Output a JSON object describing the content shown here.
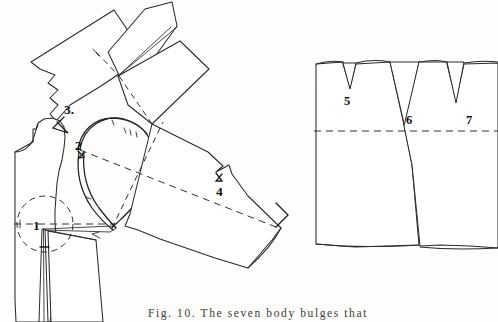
{
  "figure": {
    "caption_label": "Fig. 10.",
    "caption_text": "The seven body bulges that",
    "caption_full": "Fig. 10.   The seven body bulges that",
    "background_color": "#fdfdfc",
    "ink_color": "#2a2a2a"
  },
  "left_diagram": {
    "name": "bodice-pattern-pivoted",
    "description": "Bodice front pattern with sleeve/shoulder panels rotated open around a pivot point, armhole S-curve, bust circle and waist dart",
    "labels": [
      {
        "id": "1",
        "text": "1",
        "x": 33,
        "y": 224
      },
      {
        "id": "2",
        "text": "2",
        "x": 78,
        "y": 144
      },
      {
        "id": "3",
        "text": "3.",
        "x": 68,
        "y": 109
      },
      {
        "id": "4",
        "text": "4",
        "x": 219,
        "y": 191
      }
    ]
  },
  "right_diagram": {
    "name": "skirt-panels-with-darts",
    "description": "Two flat panels with V-darts at the top edge and a dashed horizontal hipline",
    "labels": [
      {
        "id": "5",
        "text": "5",
        "x": 348,
        "y": 100
      },
      {
        "id": "6",
        "text": "6",
        "x": 409,
        "y": 118
      },
      {
        "id": "7",
        "text": "7",
        "x": 470,
        "y": 118
      }
    ]
  },
  "markers": {
    "pivot_chevron": "chevron-right-marker",
    "bust_circle": "bust-guide-circle"
  }
}
